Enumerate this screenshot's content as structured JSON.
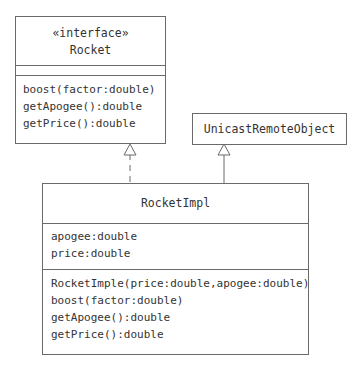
{
  "classes": {
    "rocket": {
      "stereotype": "«interface»",
      "name": "Rocket",
      "attributes": [],
      "methods": [
        "boost(factor:double)",
        "getApogee():double",
        "getPrice():double"
      ]
    },
    "unicast": {
      "name": "UnicastRemoteObject"
    },
    "rocketImpl": {
      "name": "RocketImpl",
      "attributes": [
        "apogee:double",
        "price:double"
      ],
      "methods": [
        "RocketImple(price:double,apogee:double)",
        "boost(factor:double)",
        "getApogee():double",
        "getPrice():double"
      ]
    }
  },
  "relationships": [
    {
      "type": "realization",
      "from": "RocketImpl",
      "to": "Rocket"
    },
    {
      "type": "generalization",
      "from": "RocketImpl",
      "to": "UnicastRemoteObject"
    }
  ]
}
